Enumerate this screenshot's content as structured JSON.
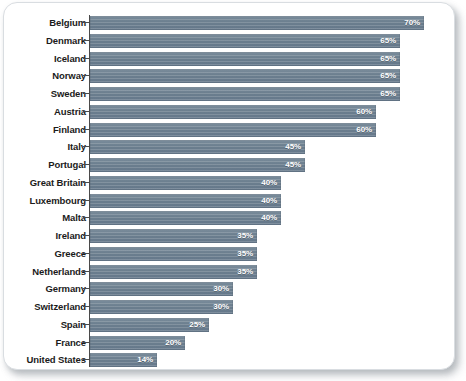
{
  "chart_data": {
    "type": "bar",
    "orientation": "horizontal",
    "title": "",
    "subtitle": "",
    "xlabel": "",
    "ylabel": "",
    "xlim": [
      0,
      72
    ],
    "grid": false,
    "legend": null,
    "value_suffix": "%",
    "categories": [
      "Belgium",
      "Denmark",
      "Iceland",
      "Norway",
      "Sweden",
      "Austria",
      "Finland",
      "Italy",
      "Portugal",
      "Great Britain",
      "Luxembourg",
      "Malta",
      "Ireland",
      "Greece",
      "Netherlands",
      "Germany",
      "Switzerland",
      "Spain",
      "France",
      "United States"
    ],
    "values": [
      70,
      65,
      65,
      65,
      65,
      60,
      60,
      45,
      45,
      40,
      40,
      40,
      35,
      35,
      35,
      30,
      30,
      25,
      20,
      14
    ],
    "value_labels": [
      "70%",
      "65%",
      "65%",
      "65%",
      "65%",
      "60%",
      "60%",
      "45%",
      "45%",
      "40%",
      "40%",
      "40%",
      "35%",
      "35%",
      "35%",
      "30%",
      "30%",
      "25%",
      "20%",
      "14%"
    ],
    "colors": {
      "bar": "#6b7e8e",
      "bar_light": "#7b8d9c",
      "value_label": "#ffffff",
      "category_label": "#1b1b1b",
      "axis": "#4a4a4a",
      "plot_background": "#ffffff",
      "card_border": "#d9dde1"
    }
  }
}
